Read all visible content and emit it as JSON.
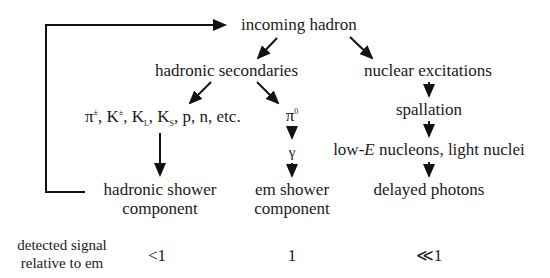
{
  "diagram": {
    "root": "incoming hadron",
    "hadronic_secondaries": "hadronic secondaries",
    "nuclear_excitations": "nuclear excitations",
    "charged_particles": {
      "pi": "π",
      "pi_sup": "±",
      "k": "K",
      "k_sup": "±",
      "kl": "K",
      "kl_sub": "L",
      "ks": "K",
      "ks_sub": "S",
      "rest": ", p, n, etc."
    },
    "pi0": {
      "base": "π",
      "sup": "0"
    },
    "gamma": "γ",
    "spallation": "spallation",
    "low_e_prefix": "low-",
    "low_e_var": "E",
    "low_e_suffix": " nucleons, light nuclei",
    "hadronic_shower": [
      "hadronic shower",
      "component"
    ],
    "em_shower": [
      "em shower",
      "component"
    ],
    "delayed_photons": "delayed photons",
    "feedback_loop": "hadronic shower component → incoming hadron"
  },
  "signal_row": {
    "label": [
      "detected signal",
      "relative to em"
    ],
    "values": [
      "<1",
      "1",
      "≪1"
    ]
  }
}
